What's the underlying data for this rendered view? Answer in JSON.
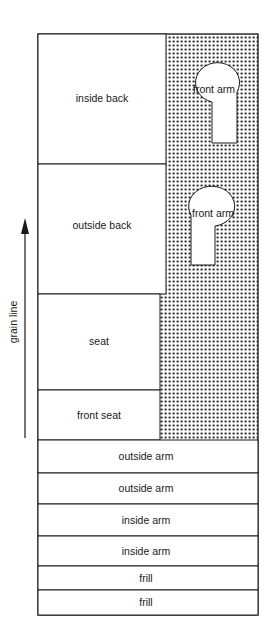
{
  "diagram": {
    "grain_line": {
      "label": "grain line"
    },
    "pieces": [
      {
        "id": "inside-back",
        "label": "inside back"
      },
      {
        "id": "outside-back",
        "label": "outside back"
      },
      {
        "id": "seat",
        "label": "seat"
      },
      {
        "id": "front-seat",
        "label": "front seat"
      },
      {
        "id": "outside-arm-1",
        "label": "outside arm"
      },
      {
        "id": "outside-arm-2",
        "label": "outside arm"
      },
      {
        "id": "inside-arm-1",
        "label": "inside arm"
      },
      {
        "id": "inside-arm-2",
        "label": "inside arm"
      },
      {
        "id": "frill-1",
        "label": "frill"
      },
      {
        "id": "frill-2",
        "label": "frill"
      }
    ],
    "front_arms": [
      {
        "id": "front-arm-1",
        "label": "front arm"
      },
      {
        "id": "front-arm-2",
        "label": "front arm"
      }
    ],
    "colors": {
      "line": "#1a1a1a",
      "fabric": "#ffffff",
      "waste_dots": "#1a1a1a"
    }
  }
}
